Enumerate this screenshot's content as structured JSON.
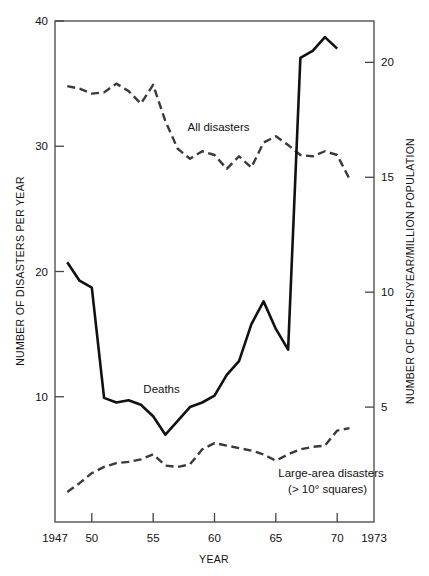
{
  "chart_data": {
    "type": "line",
    "title": "",
    "xlabel": "YEAR",
    "ylabel": "NUMBER OF DISASTERS PER YEAR",
    "y2label": "NUMBER OF DEATHS/YEAR/MILLION POPULATION",
    "xlim": [
      1947,
      1973
    ],
    "ylim": [
      0,
      40
    ],
    "y2lim": [
      0,
      21.8
    ],
    "grid": false,
    "legend_position": "inline-annotations",
    "x_ticks": [
      1947,
      1950,
      1955,
      1960,
      1965,
      1970,
      1973
    ],
    "x_tick_labels": [
      "1947",
      "50",
      "55",
      "60",
      "65",
      "70",
      "1973"
    ],
    "y_ticks": [
      10,
      20,
      30,
      40
    ],
    "y_tick_labels": [
      "10",
      "20",
      "30",
      "40"
    ],
    "y2_ticks": [
      5,
      10,
      15,
      20
    ],
    "y2_tick_labels": [
      "5",
      "10",
      "15",
      "20"
    ],
    "series": [
      {
        "name": "All disasters",
        "axis": "left",
        "style": "dashed",
        "color": "#3a3a3a",
        "x": [
          1948,
          1949,
          1950,
          1951,
          1952,
          1953,
          1954,
          1955,
          1956,
          1957,
          1958,
          1959,
          1960,
          1961,
          1962,
          1963,
          1964,
          1965,
          1966,
          1967,
          1968,
          1969,
          1970,
          1971
        ],
        "values": [
          34.8,
          34.6,
          34.2,
          34.3,
          35.0,
          34.4,
          33.4,
          34.9,
          32.0,
          29.8,
          29.0,
          29.6,
          29.3,
          28.2,
          29.2,
          28.3,
          30.3,
          30.8,
          30.1,
          29.3,
          29.2,
          29.6,
          29.3,
          27.4
        ]
      },
      {
        "name": "Deaths",
        "axis": "right",
        "style": "solid",
        "color": "#111111",
        "x": [
          1948,
          1949,
          1950,
          1951,
          1952,
          1953,
          1954,
          1955,
          1956,
          1957,
          1958,
          1959,
          1960,
          1961,
          1962,
          1963,
          1964,
          1965,
          1966,
          1967,
          1968,
          1969,
          1970
        ],
        "values": [
          11.3,
          10.5,
          10.2,
          5.4,
          5.2,
          5.3,
          5.1,
          4.6,
          3.8,
          4.4,
          5.0,
          5.2,
          5.5,
          6.4,
          7.0,
          8.6,
          9.6,
          8.4,
          7.5,
          20.2,
          20.5,
          21.1,
          20.6
        ]
      },
      {
        "name": "Large-area disasters",
        "sublabel": "(> 10° squares)",
        "axis": "left",
        "style": "dashed",
        "color": "#3a3a3a",
        "x": [
          1948,
          1949,
          1950,
          1951,
          1952,
          1953,
          1954,
          1955,
          1956,
          1957,
          1958,
          1959,
          1960,
          1961,
          1962,
          1963,
          1964,
          1965,
          1966,
          1967,
          1968,
          1969,
          1970,
          1971
        ],
        "values": [
          2.4,
          3.1,
          3.9,
          4.4,
          4.7,
          4.8,
          5.0,
          5.4,
          4.5,
          4.4,
          4.6,
          5.8,
          6.3,
          6.1,
          5.9,
          5.7,
          5.4,
          4.9,
          5.4,
          5.8,
          6.0,
          6.1,
          7.3,
          7.5
        ]
      }
    ],
    "annotations": [
      {
        "text": "All disasters",
        "x": 1957.8,
        "y": 31.2
      },
      {
        "text": "Deaths",
        "x": 1954.2,
        "y": 10.3
      },
      {
        "text": "Large-area disasters",
        "x": 1965.2,
        "y": 3.6
      },
      {
        "text": "(> 10° squares)",
        "x": 1966.0,
        "y": 2.3
      }
    ]
  },
  "labels": {
    "y_axis_title": "NUMBER OF DISASTERS PER YEAR",
    "y2_axis_title": "NUMBER OF DEATHS/YEAR/MILLION POPULATION",
    "x_axis_title": "YEAR",
    "series_all_disasters": "All disasters",
    "series_deaths": "Deaths",
    "series_large_area": "Large-area disasters",
    "series_large_area_sub": "(> 10° squares)",
    "x_tick_1947": "1947",
    "x_tick_50": "50",
    "x_tick_55": "55",
    "x_tick_60": "60",
    "x_tick_65": "65",
    "x_tick_70": "70",
    "x_tick_1973": "1973",
    "y_tick_10": "10",
    "y_tick_20": "20",
    "y_tick_30": "30",
    "y_tick_40": "40",
    "y2_tick_5": "5",
    "y2_tick_10": "10",
    "y2_tick_15": "15",
    "y2_tick_20": "20"
  },
  "colors": {
    "line_solid": "#111111",
    "line_dashed": "#3a3a3a",
    "frame": "#444444",
    "text": "#111111"
  }
}
